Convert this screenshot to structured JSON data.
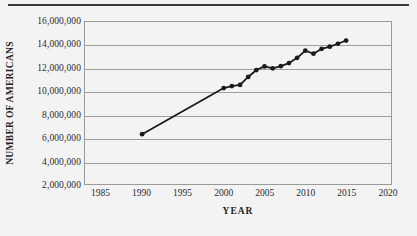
{
  "chart_data": {
    "type": "line",
    "title": "",
    "xlabel": "YEAR",
    "ylabel": "NUMBER OF AMERICANS",
    "xlim": [
      1983,
      2020.5
    ],
    "ylim": [
      2000000,
      16000000
    ],
    "xticks": [
      1985,
      1990,
      1995,
      2000,
      2005,
      2010,
      2015,
      2020
    ],
    "xtick_labels": [
      "1985",
      "1990",
      "1995",
      "2000",
      "2005",
      "2010",
      "2015",
      "2020"
    ],
    "yticks": [
      2000000,
      4000000,
      6000000,
      8000000,
      10000000,
      12000000,
      14000000,
      16000000
    ],
    "ytick_labels": [
      "2,000,000",
      "4,000,000",
      "6,000,000",
      "8,000,000",
      "10,000,000",
      "12,000,000",
      "14,000,000",
      "16,000,000"
    ],
    "grid": true,
    "grid_axis": "y",
    "legend": false,
    "marker": "circle",
    "line_color": "#1a1a1a",
    "marker_color": "#1a1a1a",
    "background_color": "#f3f3f3",
    "gridline_color": "#9e9e9e",
    "axis_border_color": "#9a9a9a",
    "series": [
      {
        "name": "Number of Americans",
        "x": [
          1990,
          2000,
          2001,
          2002,
          2003,
          2004,
          2005,
          2006,
          2007,
          2008,
          2009,
          2010,
          2011,
          2012,
          2013,
          2014,
          2015
        ],
        "y": [
          6300000,
          10290000,
          10460000,
          10560000,
          11250000,
          11850000,
          12160000,
          12000000,
          12180000,
          12450000,
          12900000,
          13520000,
          13260000,
          13680000,
          13870000,
          14120000,
          14400000
        ]
      }
    ]
  },
  "figure": {
    "top_rule": true
  }
}
